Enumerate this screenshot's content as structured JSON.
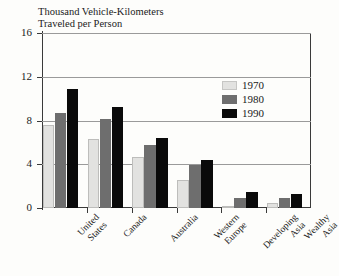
{
  "cut_title": "Personal Mobility, by Region and Income Group, 1970–1990",
  "axis_caption": {
    "line1": "Thousand Vehicle-Kilometers",
    "line2": "Traveled per Person"
  },
  "chart_data": {
    "type": "bar",
    "title": "Personal Mobility, by Region and Income Group, 1970–1990",
    "xlabel": "",
    "ylabel": "Thousand Vehicle-Kilometers Traveled per Person",
    "ylim": [
      0,
      16
    ],
    "yticks": [
      "0",
      "4",
      "8",
      "12",
      "16"
    ],
    "grid": true,
    "legend_position": "inside-top-right",
    "categories": [
      "United States",
      "Canada",
      "Australia",
      "Western Europe",
      "Developing Asia",
      "Wealthy Asia"
    ],
    "category_lines": [
      [
        "United",
        "States"
      ],
      [
        "Canada"
      ],
      [
        "Australia"
      ],
      [
        "Western",
        "Europe"
      ],
      [
        "Developing",
        "Asia"
      ],
      [
        "Wealthy",
        "Asia"
      ]
    ],
    "series": [
      {
        "name": "1970",
        "color": "#e2e2e0",
        "values": [
          7.6,
          6.3,
          4.7,
          2.6,
          0.1,
          0.5
        ]
      },
      {
        "name": "1980",
        "color": "#6e6e6e",
        "values": [
          8.7,
          8.1,
          5.8,
          3.9,
          0.9,
          0.9
        ]
      },
      {
        "name": "1990",
        "color": "#0a0a0a",
        "values": [
          10.9,
          9.2,
          6.4,
          4.4,
          1.5,
          1.3
        ]
      }
    ]
  },
  "legend": {
    "items": [
      {
        "label": "1970",
        "swatch": "s1970"
      },
      {
        "label": "1980",
        "swatch": "s1980"
      },
      {
        "label": "1990",
        "swatch": "s1990"
      }
    ]
  }
}
